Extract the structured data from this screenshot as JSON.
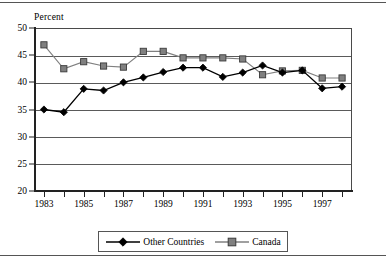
{
  "chart_data": {
    "type": "line",
    "title": "",
    "subtitle": "",
    "xlabel": "",
    "ylabel": "Percent",
    "ylim": [
      20,
      50
    ],
    "ytick_values": [
      20,
      25,
      30,
      35,
      40,
      45,
      50
    ],
    "ytick_labels": [
      "20",
      "25",
      "30",
      "35",
      "40",
      "45",
      "50"
    ],
    "grid": true,
    "grid_axis": "y",
    "legend_position": "bottom",
    "x": [
      1983,
      1984,
      1985,
      1986,
      1987,
      1988,
      1989,
      1990,
      1991,
      1992,
      1993,
      1994,
      1995,
      1996,
      1997,
      1998
    ],
    "xtick_labels": [
      "1983",
      "",
      "1985",
      "",
      "1987",
      "",
      "1989",
      "",
      "1991",
      "",
      "1993",
      "",
      "1995",
      "",
      "1997",
      ""
    ],
    "xlim": [
      1982.5,
      1998.5
    ],
    "series": [
      {
        "name": "Other Countries",
        "marker": "diamond",
        "color": "#000000",
        "values": [
          35.0,
          34.5,
          38.8,
          38.5,
          40.0,
          40.9,
          41.9,
          42.7,
          42.7,
          41.0,
          41.8,
          43.1,
          41.8,
          42.2,
          38.9,
          39.2
        ]
      },
      {
        "name": "Canada",
        "marker": "square",
        "color": "#808080",
        "values": [
          46.9,
          42.5,
          43.8,
          43.0,
          42.8,
          45.7,
          45.7,
          44.5,
          44.5,
          44.5,
          44.3,
          41.4,
          42.1,
          42.2,
          40.8,
          40.8
        ]
      }
    ]
  },
  "legend": {
    "entries": [
      {
        "label": "Other Countries",
        "marker": "diamond-marker",
        "color": "#000000"
      },
      {
        "label": "Canada",
        "marker": "square-marker",
        "color": "#808080"
      }
    ]
  }
}
